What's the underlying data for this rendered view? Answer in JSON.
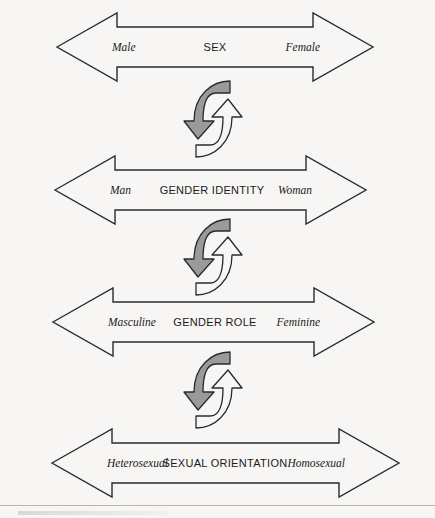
{
  "figure": {
    "background_color": "#f7f6f4",
    "line_color": "#2b2b2b",
    "accent_gray": "#9a9a9a"
  },
  "continua": [
    {
      "id": "sex",
      "center_label": "SEX",
      "left_label": "Male",
      "right_label": "Female",
      "tip_left_x": 57,
      "tip_right_x": 373,
      "center_y": 47
    },
    {
      "id": "gender-identity",
      "center_label": "GENDER IDENTITY",
      "left_label": "Man",
      "right_label": "Woman",
      "tip_left_x": 55,
      "tip_right_x": 366,
      "center_y": 190
    },
    {
      "id": "gender-role",
      "center_label": "GENDER ROLE",
      "left_label": "Masculine",
      "right_label": "Feminine",
      "tip_left_x": 53,
      "tip_right_x": 374,
      "center_y": 322
    },
    {
      "id": "sexual-orientation",
      "center_label": "SEXUAL ORIENTATION",
      "left_label": "Heterosexual",
      "right_label": "Homosexual",
      "tip_left_x": 52,
      "tip_right_x": 399,
      "center_y": 463
    }
  ],
  "connectors": [
    {
      "id": "cycle-1",
      "icon": "cycle-arrows-icon",
      "top": 79,
      "between": [
        "sex",
        "gender-identity"
      ]
    },
    {
      "id": "cycle-2",
      "icon": "cycle-arrows-icon",
      "top": 217,
      "between": [
        "gender-identity",
        "gender-role"
      ]
    },
    {
      "id": "cycle-3",
      "icon": "cycle-arrows-icon",
      "top": 350,
      "between": [
        "gender-role",
        "sexual-orientation"
      ]
    }
  ]
}
